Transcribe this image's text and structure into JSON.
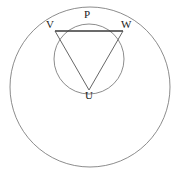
{
  "figure": {
    "background_color": "#ffffff",
    "stroke_color": "#6e6e6e",
    "chord_color": "#3a3a3a",
    "label_color": "#1a1a1a",
    "width": 179,
    "height": 176
  },
  "labels": {
    "p": "P",
    "v": "V",
    "w": "W",
    "u": "U"
  },
  "points": {
    "P": {
      "name": "P",
      "x": 89,
      "y": 24
    },
    "V": {
      "name": "V",
      "x": 55,
      "y": 31
    },
    "W": {
      "name": "W",
      "x": 123,
      "y": 31
    },
    "U": {
      "name": "U",
      "x": 89,
      "y": 90
    }
  },
  "label_positions": {
    "p": {
      "x": 84,
      "y": 9
    },
    "v": {
      "x": 46,
      "y": 19
    },
    "w": {
      "x": 121,
      "y": 19
    },
    "u": {
      "x": 85,
      "y": 90
    }
  },
  "circles": {
    "small": {
      "name": "circumcircle-UVW",
      "cx": 89,
      "cy": 59,
      "r": 35
    },
    "large": {
      "name": "outer-circle",
      "cx": 90,
      "cy": 87,
      "r": 80
    }
  },
  "segments": [
    {
      "name": "chord-VW",
      "from": "V",
      "to": "W"
    },
    {
      "name": "segment-UV",
      "from": "U",
      "to": "V"
    },
    {
      "name": "segment-UW",
      "from": "U",
      "to": "W"
    }
  ]
}
